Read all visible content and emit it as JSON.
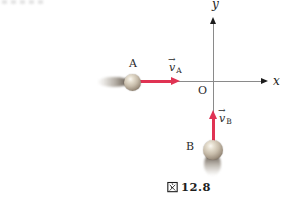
{
  "figure": {
    "caption": {
      "kanji": "図",
      "number": "12.8",
      "full": "図 12.8"
    },
    "axes": {
      "x_label": "x",
      "y_label": "y",
      "origin_label": "O"
    },
    "objects": {
      "A": {
        "label": "A",
        "velocity_symbol": "v",
        "vector_arrow": "→",
        "velocity_subscript": "A",
        "motion_direction": "+x (rightward toward origin along x-axis)"
      },
      "B": {
        "label": "B",
        "velocity_symbol": "v",
        "vector_arrow": "→",
        "velocity_subscript": "B",
        "motion_direction": "+y (upward toward origin along y-axis)"
      }
    },
    "colors": {
      "velocity_arrow": "#e03353",
      "axis_line": "#8a8a8a",
      "axis_arrowhead": "#1c1c1c",
      "label_text": "#2b2b2b",
      "ball_shading": "#c7bcaa",
      "background": "#ffffff"
    }
  }
}
